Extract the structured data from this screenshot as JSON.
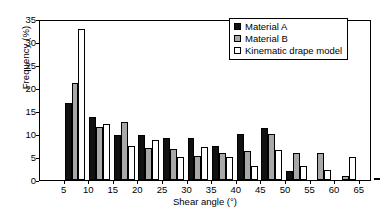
{
  "chart_data": {
    "type": "bar",
    "title": "",
    "xlabel": "Shear angle (°)",
    "ylabel": "Frequency (%)",
    "xlim": [
      0,
      67.5
    ],
    "ylim": [
      0,
      35
    ],
    "yticks": [
      0,
      5,
      10,
      15,
      20,
      25,
      30,
      35
    ],
    "xticks": [
      5,
      10,
      15,
      20,
      25,
      30,
      35,
      40,
      45,
      50,
      55,
      60,
      65
    ],
    "categories": [
      "5",
      "10",
      "15",
      "20",
      "25",
      "30",
      "35",
      "40",
      "45",
      "50",
      "55",
      "60",
      "65"
    ],
    "grid": false,
    "legend_position": "top-right",
    "series": [
      {
        "name": "Material A",
        "color": "#111111",
        "values": [
          16.8,
          13.6,
          9.8,
          9.8,
          9.2,
          9.2,
          7.4,
          10.0,
          11.4,
          2.0,
          0,
          0,
          0
        ]
      },
      {
        "name": "Material B",
        "color": "#a8a8a8",
        "values": [
          21.1,
          11.5,
          12.6,
          7.0,
          6.7,
          5.2,
          5.9,
          6.2,
          10.0,
          5.9,
          5.9,
          0.8,
          0
        ]
      },
      {
        "name": "Kinematic drape model",
        "color": "#ffffff",
        "values": [
          32.8,
          12.1,
          7.3,
          8.8,
          4.9,
          7.2,
          4.9,
          3.1,
          6.5,
          3.1,
          2.2,
          4.9,
          0.4
        ]
      }
    ]
  },
  "axes": {
    "ylabel": "Frequency (%)",
    "xlabel": "Shear angle (°)",
    "yticklabels": [
      "0",
      "5",
      "10",
      "15",
      "20",
      "25",
      "30",
      "35"
    ],
    "xticklabels": [
      "5",
      "10",
      "15",
      "20",
      "25",
      "30",
      "35",
      "40",
      "45",
      "50",
      "55",
      "60",
      "65"
    ]
  },
  "legend": {
    "items": [
      {
        "label": "Material A",
        "color": "#111111"
      },
      {
        "label": "Material B",
        "color": "#a8a8a8"
      },
      {
        "label": "Kinematic drape model",
        "color": "#ffffff"
      }
    ]
  }
}
